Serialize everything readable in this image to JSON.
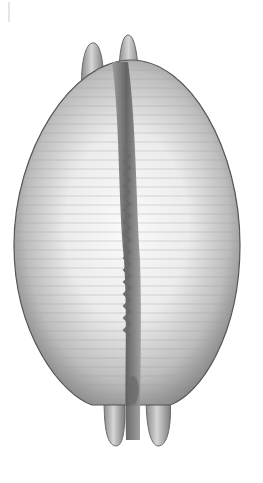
{
  "image": {
    "subject": "cowrie shell, ventral view",
    "background_color": "#ffffff",
    "palette": {
      "shell_light": "#f4f4f4",
      "shell_mid": "#c8c8c8",
      "shell_edge": "#6e6e6e",
      "aperture_dark": "#5a5a5a",
      "teeth": "#7a7a7a"
    }
  }
}
